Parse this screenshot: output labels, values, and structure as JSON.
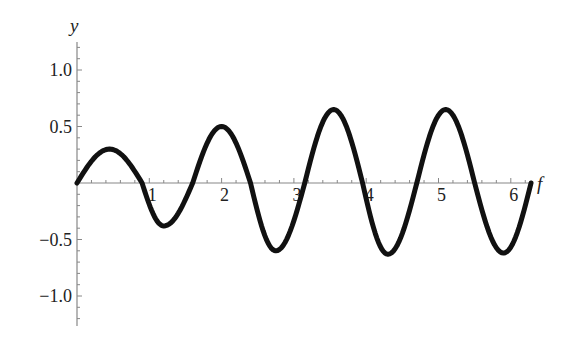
{
  "chart_data": {
    "type": "line",
    "title": "",
    "xlabel": "f",
    "ylabel": "y",
    "xlim": [
      0,
      6.2832
    ],
    "ylim": [
      -1.25,
      1.25
    ],
    "grid": false,
    "legend": null,
    "x_ticks": [
      1,
      2,
      3,
      4,
      5,
      6
    ],
    "x_tick_labels": [
      "1",
      "2",
      "3",
      "4",
      "5",
      "6"
    ],
    "y_ticks": [
      -1.0,
      -0.5,
      0.5,
      1.0
    ],
    "y_tick_labels": [
      "−1.0",
      "−0.5",
      "0.5",
      "1.0"
    ],
    "series": [
      {
        "name": "y(f)",
        "color": "#111111",
        "x": [
          0,
          0.45,
          0.9,
          1.2,
          1.6,
          2.0,
          2.4,
          2.75,
          3.15,
          3.55,
          3.95,
          4.3,
          4.7,
          5.1,
          5.5,
          5.9,
          6.28
        ],
        "y": [
          0,
          0.3,
          0,
          -0.38,
          0,
          0.5,
          0,
          -0.6,
          0,
          0.65,
          0,
          -0.63,
          0,
          0.65,
          0,
          -0.62,
          0
        ]
      }
    ]
  }
}
